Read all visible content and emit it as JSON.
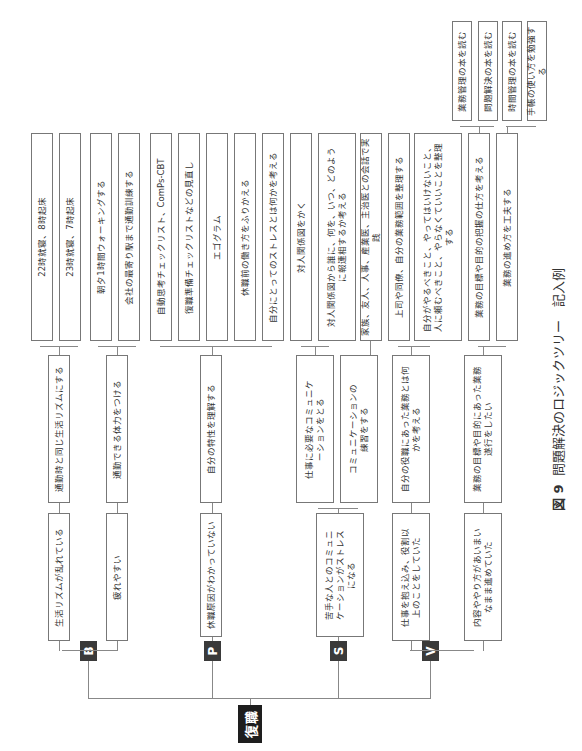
{
  "root": {
    "label": "復職"
  },
  "branches": [
    {
      "tag": "B",
      "problems": [
        {
          "text": "生活リズムが乱れている",
          "actions": [
            {
              "text": "通勤時と同じ生活リズムにする",
              "details": [
                "22時就寝、8時起床",
                "23時就寝、7時起床"
              ]
            }
          ]
        },
        {
          "text": "疲れやすい",
          "actions": [
            {
              "text": "通勤できる体力をつける",
              "details": [
                "朝夕1時間ウォーキングする",
                "会社の最寄り駅まで通勤訓練する"
              ]
            }
          ]
        }
      ]
    },
    {
      "tag": "P",
      "problems": [
        {
          "text": "休職原因がわかっていない",
          "actions": [
            {
              "text": "自分の特性を理解する",
              "details": [
                "自動思考チェックリスト、ComPs-CBT",
                "復職準備チェックリストなどの見直し",
                "エゴグラム",
                "休職前の働き方をふりかえる",
                "自分にとってのストレスとは何かを考える"
              ]
            }
          ]
        }
      ]
    },
    {
      "tag": "S",
      "problems": [
        {
          "text": "苦手な人とのコミュニケーションがストレスになる",
          "actions": [
            {
              "text": "仕事に必要なコミュニケーションをとる",
              "details": [
                "対人関係図をかく",
                "対人関係図から誰に、何を、いつ、どのように報連相するか考える"
              ]
            },
            {
              "text": "コミュニケーションの練習をする",
              "details": [
                "家族、友人、人事、産業医、主治医との会話で実践"
              ]
            }
          ]
        }
      ]
    },
    {
      "tag": "V",
      "problems": [
        {
          "text": "仕事を抱え込み、役割以上のことをしていた",
          "actions": [
            {
              "text": "自分の役職にあった業務とは何かを考える",
              "details": [
                "上司や同僚、自分の業務範囲を整理する",
                "自分がやるべきこと、やってはいけないこと、人に頼むべきこと、やらなくていいことを整理する"
              ]
            }
          ]
        },
        {
          "text": "内容ややり方があいまいなまま進めていた",
          "actions": [
            {
              "text": "業務の目標や目的にあった業務遂行をしたい",
              "details": []
            }
          ],
          "sub": [
            {
              "text": "業務の目標や目的の把握の仕方を考える",
              "details": [
                "業務管理の本を読む",
                "問題解決の本を読む"
              ]
            },
            {
              "text": "業務の進め方を工夫する",
              "details": [
                "時間管理の本を読む",
                "手帳の使い方を勉強する"
              ]
            }
          ]
        }
      ]
    }
  ],
  "caption": {
    "figure_no": "図 9",
    "title": "問題解決のロジックツリー　記入例"
  }
}
